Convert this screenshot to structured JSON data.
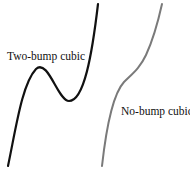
{
  "figure": {
    "curves": [
      {
        "name": "Two-bump cubic",
        "color": "#111111",
        "stroke_width": 2.2,
        "path": "M 8 166 C 16 128, 22 84, 36 69 C 48 58, 58 101, 69 101 C 84 101, 92 55, 98 4",
        "features": [
          "local maximum",
          "local minimum"
        ]
      },
      {
        "name": "No-bump cubic",
        "color": "#7a7a7a",
        "stroke_width": 2.0,
        "path": "M 102 166 C 106 130, 112 95, 124 82 C 132 74, 140 68, 146 55 C 152 42, 158 22, 162 4",
        "features": [
          "inflection, no turning points"
        ]
      }
    ],
    "labels": {
      "two_bump": "Two-bump cubic",
      "no_bump": "No-bump cubic"
    }
  }
}
